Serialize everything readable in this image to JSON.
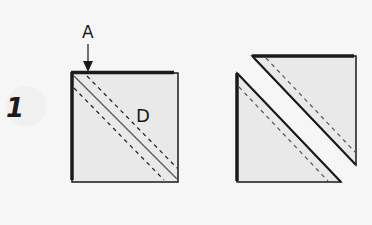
{
  "diagram": {
    "step_number": "1",
    "labels": {
      "a": "A",
      "d": "D"
    },
    "colors": {
      "background": "#f6f6f6",
      "fabric_fill": "#e9e9e9",
      "outline": "#1a1a1a",
      "seam_line": "#555555"
    }
  }
}
